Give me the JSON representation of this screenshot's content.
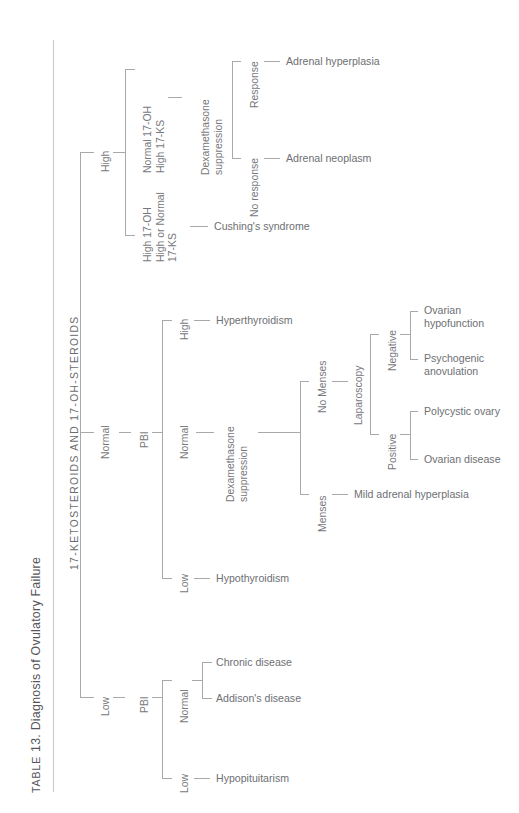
{
  "caption": {
    "label_small": "TABLE",
    "number": "13.",
    "title": "Diagnosis of Ovulatory Failure",
    "full": "TABLE 13. Diagnosis of Ovulatory Failure"
  },
  "column_header": "17-KETOSTEROIDS AND 17-OH-STEROIDS",
  "colors": {
    "text": "#6f6f6f",
    "line": "#a9a9a9",
    "rule": "#c9c9c9",
    "background": "#ffffff"
  },
  "tree": {
    "root_label": "17-KETOSTEROIDS AND 17-OH-STEROIDS",
    "branches": [
      {
        "id": "high",
        "label": "High",
        "children": [
          {
            "id": "high-normal17oh",
            "label": "Normal 17-OH\nHigh 17-KS",
            "label_lines": [
              "Normal 17-OH",
              "High 17-KS"
            ],
            "test": "Dexamethasone\nsuppression",
            "test_lines": [
              "Dexamethasone",
              "suppression"
            ],
            "outcomes": [
              {
                "label": "Response",
                "diagnosis": "Adrenal hyperplasia"
              },
              {
                "label": "No response",
                "diagnosis": "Adrenal neoplasm"
              }
            ]
          },
          {
            "id": "high-high17oh",
            "label": "High 17-OH\nHigh or Normal\n17-KS",
            "label_lines": [
              "High 17-OH",
              "High or Normal",
              "17-KS"
            ],
            "diagnosis": "Cushing's syndrome"
          }
        ]
      },
      {
        "id": "normal",
        "label": "Normal",
        "test": "PBI",
        "children": [
          {
            "id": "pbi-high",
            "label": "High",
            "diagnosis": "Hyperthyroidism"
          },
          {
            "id": "pbi-normal",
            "label": "Normal",
            "test": "Dexamethasone\nsuppression",
            "test_lines": [
              "Dexamethasone",
              "suppression"
            ],
            "outcomes": [
              {
                "label": "No Menses",
                "test": "Laparoscopy",
                "results": [
                  {
                    "label": "Negative",
                    "diagnoses": [
                      {
                        "lines": [
                          "Ovarian",
                          "hypofunction"
                        ]
                      },
                      {
                        "lines": [
                          "Psychogenic",
                          "anovulation"
                        ]
                      }
                    ]
                  },
                  {
                    "label": "Positive",
                    "diagnoses": [
                      {
                        "lines": [
                          "Polycystic ovary"
                        ]
                      },
                      {
                        "lines": [
                          "Ovarian disease"
                        ]
                      }
                    ]
                  }
                ]
              },
              {
                "label": "Menses",
                "diagnosis": "Mild adrenal hyperplasia"
              }
            ]
          },
          {
            "id": "pbi-low",
            "label": "Low",
            "diagnosis": "Hypothyroidism"
          }
        ]
      },
      {
        "id": "low",
        "label": "Low",
        "test": "PBI",
        "children": [
          {
            "id": "low-pbi-normal",
            "label": "Normal",
            "diagnoses": [
              "Chronic disease",
              "Addison's disease"
            ]
          },
          {
            "id": "low-pbi-low",
            "label": "Low",
            "diagnosis": "Hypopituitarism"
          }
        ]
      }
    ]
  },
  "labels": {
    "high": "High",
    "normal": "Normal",
    "low": "Low",
    "pbi": "PBI",
    "normal_17oh": "Normal 17-OH",
    "high_17ks": "High 17-KS",
    "high_17oh": "High 17-OH",
    "high_or_normal": "High or Normal",
    "l17ks": "17-KS",
    "dexamethasone": "Dexamethasone",
    "suppression": "suppression",
    "response": "Response",
    "no_response": "No response",
    "adrenal_hyperplasia": "Adrenal hyperplasia",
    "adrenal_neoplasm": "Adrenal neoplasm",
    "cushings": "Cushing's syndrome",
    "hyperthyroidism": "Hyperthyroidism",
    "hypothyroidism": "Hypothyroidism",
    "no_menses": "No Menses",
    "menses": "Menses",
    "laparoscopy": "Laparoscopy",
    "negative": "Negative",
    "positive": "Positive",
    "ovarian": "Ovarian",
    "hypofunction": "hypofunction",
    "psychogenic": "Psychogenic",
    "anovulation": "anovulation",
    "polycystic_ovary": "Polycystic ovary",
    "ovarian_disease": "Ovarian disease",
    "mild_adrenal_hyperplasia": "Mild adrenal hyperplasia",
    "chronic_disease": "Chronic disease",
    "addisons_disease": "Addison's disease",
    "hypopituitarism": "Hypopituitarism"
  }
}
